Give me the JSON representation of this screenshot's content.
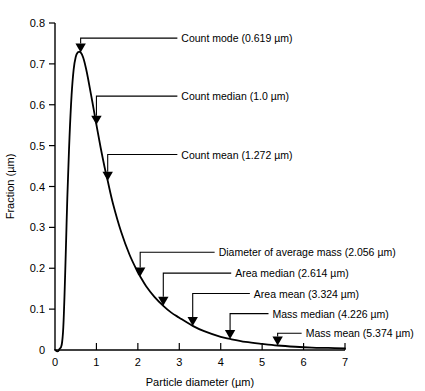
{
  "chart_data": {
    "type": "line",
    "title": "",
    "xlabel": "Particle diameter (µm)",
    "ylabel": "Fraction (µm)",
    "xlim": [
      0,
      7
    ],
    "ylim": [
      0,
      0.8
    ],
    "grid": false,
    "legend": "none",
    "x_ticks": [
      "0",
      "1",
      "2",
      "3",
      "4",
      "5",
      "6",
      "7"
    ],
    "x_tick_values": [
      0,
      1,
      2,
      3,
      4,
      5,
      6,
      7
    ],
    "y_ticks": [
      "0",
      "0.1",
      "0.2",
      "0.3",
      "0.4",
      "0.5",
      "0.6",
      "0.7",
      "0.8"
    ],
    "y_tick_values": [
      0,
      0.1,
      0.2,
      0.3,
      0.4,
      0.5,
      0.6,
      0.7,
      0.8
    ],
    "series": [
      {
        "name": "Count distribution (lognormal)",
        "x": [
          0.0,
          0.1,
          0.2,
          0.3,
          0.35,
          0.4,
          0.45,
          0.5,
          0.55,
          0.6,
          0.619,
          0.65,
          0.7,
          0.75,
          0.8,
          0.9,
          1.0,
          1.1,
          1.2,
          1.272,
          1.4,
          1.6,
          1.8,
          2.0,
          2.056,
          2.2,
          2.4,
          2.614,
          2.8,
          3.0,
          3.324,
          3.6,
          4.0,
          4.226,
          4.6,
          5.0,
          5.374,
          5.8,
          6.2,
          6.6,
          7.0
        ],
        "y": [
          0.0,
          0.001,
          0.055,
          0.38,
          0.52,
          0.623,
          0.686,
          0.717,
          0.728,
          0.729,
          0.728,
          0.723,
          0.709,
          0.688,
          0.663,
          0.608,
          0.551,
          0.496,
          0.446,
          0.414,
          0.358,
          0.288,
          0.233,
          0.19,
          0.18,
          0.156,
          0.13,
          0.108,
          0.092,
          0.079,
          0.059,
          0.046,
          0.032,
          0.027,
          0.02,
          0.015,
          0.011,
          0.008,
          0.006,
          0.005,
          0.004
        ]
      }
    ],
    "annotations": [
      {
        "id": "count-mode",
        "label": "Count mode (0.619 µm)",
        "x": 0.619,
        "y": 0.728,
        "text_x": 3.05,
        "text_y": 0.768
      },
      {
        "id": "count-median",
        "label": "Count median (1.0 µm)",
        "x": 1.0,
        "y": 0.551,
        "text_x": 3.05,
        "text_y": 0.626
      },
      {
        "id": "count-mean",
        "label": "Count mean (1.272 µm)",
        "x": 1.272,
        "y": 0.414,
        "text_x": 3.05,
        "text_y": 0.483
      },
      {
        "id": "diam-avg-mass",
        "label": "Diameter of average mass (2.056 µm)",
        "x": 2.056,
        "y": 0.18,
        "text_x": 3.95,
        "text_y": 0.244
      },
      {
        "id": "area-median",
        "label": "Area median (2.614 µm)",
        "x": 2.614,
        "y": 0.108,
        "text_x": 4.35,
        "text_y": 0.193
      },
      {
        "id": "area-mean",
        "label": "Area mean (3.324 µm)",
        "x": 3.324,
        "y": 0.059,
        "text_x": 4.8,
        "text_y": 0.143
      },
      {
        "id": "mass-median",
        "label": "Mass median (4.226 µm)",
        "x": 4.226,
        "y": 0.027,
        "text_x": 5.25,
        "text_y": 0.094
      },
      {
        "id": "mass-mean",
        "label": "Mass mean (5.374 µm)",
        "x": 5.374,
        "y": 0.011,
        "text_x": 6.05,
        "text_y": 0.046
      }
    ]
  },
  "axes": {
    "x_title": "Particle diameter (µm)",
    "y_title": "Fraction (µm)"
  },
  "colors": {
    "curve": "#000000",
    "axis": "#000000",
    "text": "#000000",
    "background": "#ffffff"
  }
}
